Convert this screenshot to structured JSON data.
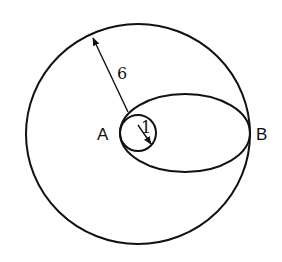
{
  "diagram": {
    "labels": {
      "point_a": "A",
      "point_b": "B",
      "outer_radius": "6",
      "inner_radius": "1"
    },
    "shapes": {
      "outer_circle": "circle radius 6",
      "inner_circle": "circle radius 1 at A",
      "ellipse": "ellipse through A and B"
    },
    "colors": {
      "stroke": "#111111",
      "background": "#ffffff"
    }
  }
}
